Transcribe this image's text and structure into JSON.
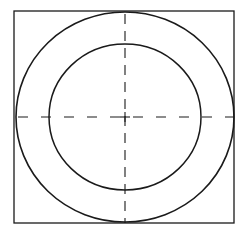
{
  "diagram": {
    "type": "geometric-figure",
    "stroke_color": "#1a1a1a",
    "background_color": "#ffffff",
    "square": {
      "x": 14,
      "y": 11,
      "width": 220,
      "height": 212,
      "stroke_width": 1.3
    },
    "center": {
      "x": 125,
      "y": 117
    },
    "outer_circle": {
      "cx": 125,
      "cy": 117,
      "rx": 109,
      "ry": 105,
      "stroke_width": 1.6
    },
    "inner_circle": {
      "cx": 125,
      "cy": 117,
      "rx": 76,
      "ry": 73,
      "stroke_width": 1.5
    },
    "center_lines": {
      "style": "dashed",
      "vertical": {
        "x": 125,
        "y1": 11,
        "y2": 223,
        "dash": "10 7"
      },
      "horizontal": {
        "y": 117,
        "x1": 14,
        "x2": 234,
        "dash": "10 13"
      }
    },
    "center_mark": {
      "size": 5
    }
  }
}
